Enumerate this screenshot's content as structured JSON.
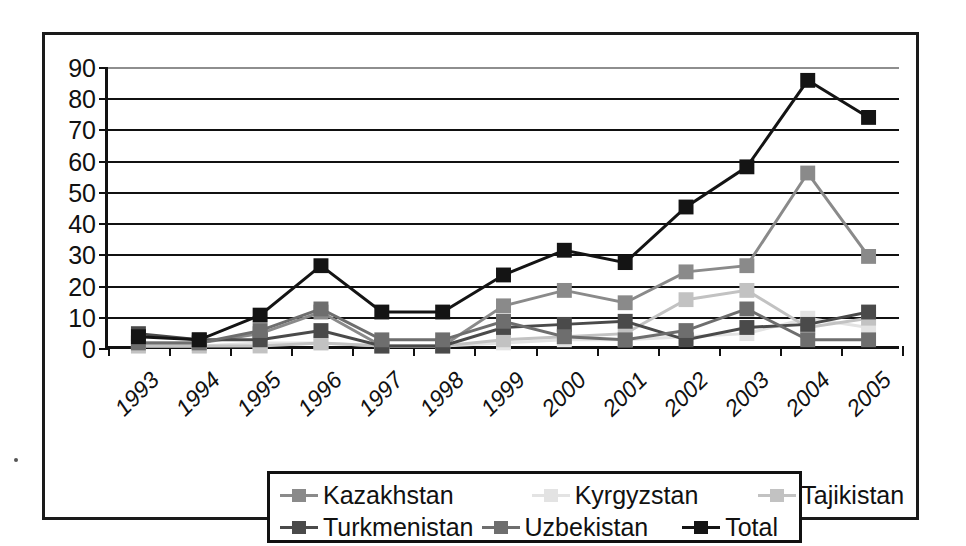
{
  "chart_data": {
    "type": "line",
    "title": "",
    "subtitle": "",
    "xlabel": "",
    "ylabel": "",
    "categories": [
      "1993",
      "1994",
      "1995",
      "1996",
      "1997",
      "1998",
      "1999",
      "2000",
      "2001",
      "2002",
      "2003",
      "2004",
      "2005"
    ],
    "ylim": [
      0,
      90
    ],
    "ytick_values": [
      0,
      10,
      20,
      30,
      40,
      50,
      60,
      70,
      80,
      90
    ],
    "ytick_labels": [
      "0",
      "10",
      "20",
      "30",
      "40",
      "50",
      "60",
      "70",
      "80",
      "90"
    ],
    "grid": true,
    "grid_axis": "y",
    "legend_position": "bottom",
    "xtick_label_rotation": -45,
    "series": [
      {
        "name": "Kazakhstan",
        "color": "#8a8a8a",
        "marker": "square",
        "values": [
          1,
          1,
          4,
          11,
          0,
          0,
          13,
          18,
          14,
          24,
          26,
          56,
          29
        ]
      },
      {
        "name": "Kyrgyzstan",
        "color": "#e3e3e3",
        "marker": "square",
        "values": [
          0,
          0,
          1,
          1,
          0,
          0,
          1,
          2,
          2,
          3,
          4,
          9,
          6
        ]
      },
      {
        "name": "Tajikistan",
        "color": "#c2c2c2",
        "marker": "square",
        "values": [
          0,
          0,
          0,
          1,
          0,
          0,
          2,
          3,
          4,
          15,
          18,
          6,
          9
        ]
      },
      {
        "name": "Turkmenistan",
        "color": "#4a4a4a",
        "marker": "square",
        "values": [
          4,
          2,
          2,
          5,
          0,
          0,
          6,
          7,
          8,
          2,
          6,
          7,
          11
        ]
      },
      {
        "name": "Uzbekistan",
        "color": "#6e6e6e",
        "marker": "square",
        "values": [
          1,
          1,
          5,
          12,
          2,
          2,
          8,
          3,
          2,
          5,
          12,
          2,
          2
        ]
      },
      {
        "name": "Total",
        "color": "#141414",
        "marker": "square",
        "values": [
          3,
          2,
          10,
          26,
          11,
          11,
          23,
          31,
          27,
          45,
          58,
          86,
          74
        ]
      }
    ]
  },
  "legend": {
    "rows": [
      [
        "Kazakhstan",
        "Kyrgyzstan",
        "Tajikistan"
      ],
      [
        "Turkmenistan",
        "Uzbekistan",
        "Total"
      ]
    ]
  }
}
